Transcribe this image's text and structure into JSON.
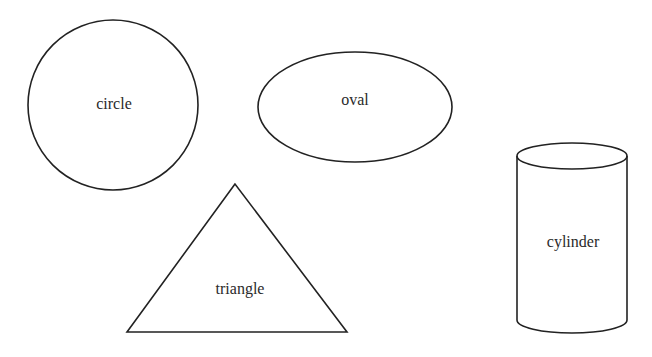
{
  "shapes": {
    "circle": {
      "label": "circle"
    },
    "oval": {
      "label": "oval"
    },
    "triangle": {
      "label": "triangle"
    },
    "cylinder": {
      "label": "cylinder"
    }
  },
  "colors": {
    "stroke": "#222222",
    "background": "#ffffff"
  }
}
